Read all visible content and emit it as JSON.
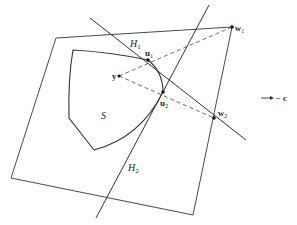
{
  "diagram": {
    "type": "convex-set-separating-hyperplanes",
    "colors": {
      "stroke": "#333333",
      "background": "#ffffff"
    },
    "labels": {
      "H1": {
        "main": "H",
        "sub": "1"
      },
      "H2": {
        "main": "H",
        "sub": "2"
      },
      "u1": {
        "main": "u",
        "sub": "1"
      },
      "u2": {
        "main": "u",
        "sub": "2"
      },
      "w1": {
        "main": "w",
        "sub": "1"
      },
      "w2": {
        "main": "w",
        "sub": "2"
      },
      "y": "y",
      "S": "S",
      "direction": "− c"
    },
    "points": {
      "u1": [
        148,
        60
      ],
      "u2": [
        163,
        92
      ],
      "w1": [
        232,
        27
      ],
      "w2": [
        214,
        118
      ],
      "y": [
        119,
        76
      ]
    }
  }
}
